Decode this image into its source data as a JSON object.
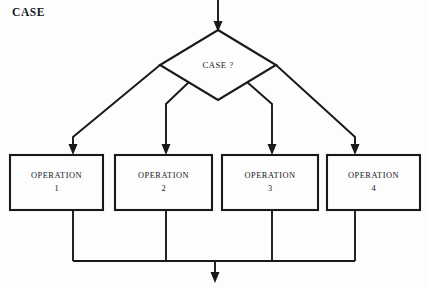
{
  "diagram": {
    "title": "CASE",
    "type": "flowchart",
    "decision": {
      "label": "CASE ?",
      "shape": "diamond",
      "cx": 218,
      "cy": 65,
      "half_width": 58,
      "half_height": 35
    },
    "entry_arrow": {
      "name": "entry-arrow",
      "from_y": 0,
      "to_y": 30,
      "x": 218
    },
    "exit_arrow": {
      "name": "exit-arrow",
      "x": 215,
      "from_y": 261,
      "to_y": 283
    },
    "merge_line": {
      "y": 261,
      "x_start": 73,
      "x_end": 355
    },
    "operations": [
      {
        "label": "OPERATION",
        "number": "1",
        "x": 10,
        "y": 155,
        "width": 93,
        "height": 55,
        "center_x": 56.5,
        "branch_arrow_x": 73
      },
      {
        "label": "OPERATION",
        "number": "2",
        "x": 115,
        "y": 155,
        "width": 97,
        "height": 55,
        "center_x": 163.5,
        "branch_arrow_x": 166
      },
      {
        "label": "OPERATION",
        "number": "3",
        "x": 222,
        "y": 155,
        "width": 96,
        "height": 55,
        "center_x": 270,
        "branch_arrow_x": 272
      },
      {
        "label": "OPERATION",
        "number": "4",
        "x": 327,
        "y": 155,
        "width": 93,
        "height": 55,
        "center_x": 373.5,
        "branch_arrow_x": 355
      }
    ],
    "colors": {
      "stroke": "#18181d",
      "background": "#fdfdfd",
      "text": "#17171c"
    }
  }
}
